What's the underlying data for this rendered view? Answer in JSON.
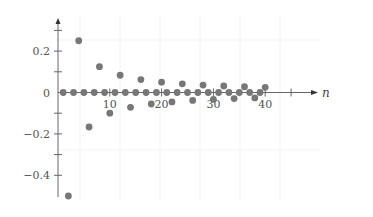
{
  "chart_data": {
    "type": "scatter",
    "title": "",
    "xlabel": "n",
    "ylabel": "",
    "xlim": [
      0,
      45
    ],
    "ylim": [
      -0.5,
      0.3
    ],
    "x_ticks": [
      10,
      20,
      30,
      40
    ],
    "x_tick_labels": [
      "10",
      "20",
      "30",
      "40"
    ],
    "y_ticks": [
      0.2,
      0,
      -0.2,
      -0.4
    ],
    "y_tick_labels": [
      "0.2",
      "0",
      "−0.2",
      "−0.4"
    ],
    "y_minor_ticks": [
      0.3,
      0.1,
      -0.1,
      -0.3
    ],
    "grid": false,
    "legend": null,
    "series": [
      {
        "name": "a_n",
        "color": "#777777",
        "x": [
          1,
          2,
          3,
          4,
          5,
          6,
          7,
          8,
          9,
          10,
          11,
          12,
          13,
          14,
          15,
          16,
          17,
          18,
          19,
          20,
          21,
          22,
          23,
          24,
          25,
          26,
          27,
          28,
          29,
          30,
          31,
          32,
          33,
          34,
          35,
          36,
          37,
          38,
          39,
          40
        ],
        "values": [
          0,
          -0.5,
          0,
          0.25,
          0,
          -0.1667,
          0,
          0.125,
          0,
          -0.1,
          0,
          0.0833,
          0,
          -0.0714,
          0,
          0.0625,
          0,
          -0.0556,
          0,
          0.05,
          0,
          -0.0455,
          0,
          0.0417,
          0,
          -0.0385,
          0,
          0.0357,
          0,
          -0.0333,
          0,
          0.0313,
          0,
          -0.0294,
          0,
          0.0278,
          0,
          -0.0263,
          0,
          0.025
        ]
      }
    ]
  }
}
